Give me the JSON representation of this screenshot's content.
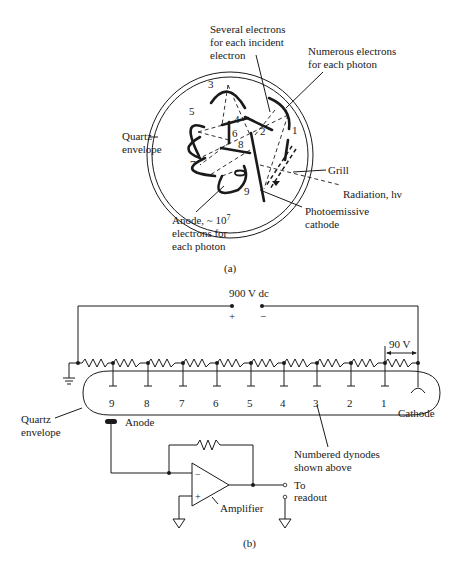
{
  "header": {
    "partial_text": "...tiplier tube. (a) Cross section of the tube; (b) electrical schematic."
  },
  "figure_a": {
    "caption": "(a)",
    "labels": {
      "several_line1": "Several electrons",
      "several_line2": "for each incident",
      "several_line3": "electron",
      "numerous_line1": "Numerous electrons",
      "numerous_line2": "for each photon",
      "quartz_line1": "Quartz",
      "quartz_line2": "envelope",
      "grill": "Grill",
      "radiation": "Radiation, hν",
      "cathode_line1": "Photoemissive",
      "cathode_line2": "cathode",
      "anode_line1": "Anode, ~ 10",
      "anode_exp": "7",
      "anode_line2": "electrons for",
      "anode_line3": "each photon"
    },
    "dynode_numbers": [
      "1",
      "2",
      "3",
      "4",
      "5",
      "6",
      "7",
      "8",
      "9"
    ]
  },
  "figure_b": {
    "caption": "(b)",
    "supply_label": "900 V dc",
    "plus": "+",
    "minus": "−",
    "step_voltage": "90 V",
    "dynode_numbers": [
      "9",
      "8",
      "7",
      "6",
      "5",
      "4",
      "3",
      "2",
      "1"
    ],
    "cathode_label": "Cathode",
    "anode_label": "Anode",
    "quartz_line1": "Quartz",
    "quartz_line2": "envelope",
    "numbered_line1": "Numbered dynodes",
    "numbered_line2": "shown above",
    "amp_minus": "−",
    "amp_plus": "+",
    "amplifier_label": "Amplifier",
    "readout_line1": "To",
    "readout_line2": "readout"
  }
}
